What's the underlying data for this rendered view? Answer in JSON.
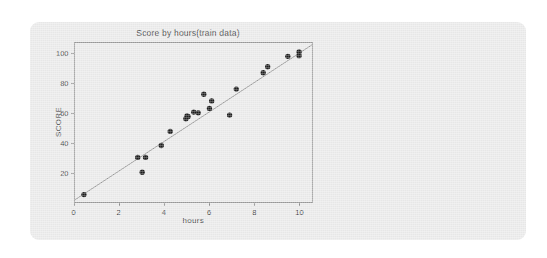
{
  "chart_data": {
    "type": "scatter",
    "title": "Score by hours(train data)",
    "xlabel": "hours",
    "ylabel": "SCORE",
    "xlim": [
      0,
      10.6
    ],
    "ylim": [
      0,
      107
    ],
    "grid": false,
    "legend": "none",
    "xticks": [
      "0",
      "2",
      "4",
      "6",
      "8",
      "10"
    ],
    "xtick_values": [
      0,
      2,
      4,
      6,
      8,
      10
    ],
    "yticks": [
      "20",
      "40",
      "60",
      "80",
      "100"
    ],
    "ytick_values": [
      20,
      40,
      60,
      80,
      100
    ],
    "series": [
      {
        "name": "train data",
        "type": "scatter",
        "marker": "circle",
        "color": "#1c1c1c",
        "x": [
          0.4,
          2.8,
          3.0,
          3.15,
          3.85,
          4.25,
          4.95,
          5.0,
          5.05,
          5.3,
          5.5,
          5.75,
          6.0,
          6.1,
          6.9,
          7.2,
          8.4,
          8.6,
          9.5,
          10.0,
          10.0
        ],
        "y": [
          5.0,
          30.0,
          20.0,
          30.0,
          38.0,
          47.5,
          56.0,
          58.0,
          57.5,
          60.5,
          60.0,
          72.5,
          63.0,
          68.0,
          58.5,
          76.0,
          87.0,
          91.0,
          98.0,
          101.0,
          98.5
        ]
      },
      {
        "name": "regression line",
        "type": "line",
        "color": "#8a8a8a",
        "x": [
          0.0,
          10.6
        ],
        "y": [
          1.5,
          106.0
        ]
      }
    ],
    "annotations": []
  },
  "colors": {
    "page_background": "#ffffff",
    "card_background": "#ebebeb",
    "frame": "#9a9a9a",
    "point": "#1c1c1c",
    "line": "#8a8a8a",
    "text": "#3f3f3f"
  }
}
